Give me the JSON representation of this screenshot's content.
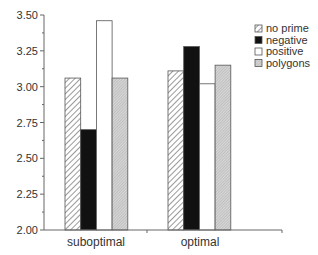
{
  "chart_data": {
    "type": "bar",
    "title": "",
    "xlabel": "",
    "ylabel": "",
    "categories": [
      "suboptimal",
      "optimal"
    ],
    "series": [
      {
        "name": "no prime",
        "pattern": "diagonal-hatch",
        "values": [
          3.06,
          3.11
        ]
      },
      {
        "name": "negative",
        "pattern": "solid-black",
        "values": [
          2.7,
          3.28
        ]
      },
      {
        "name": "positive",
        "pattern": "white",
        "values": [
          3.46,
          3.02
        ]
      },
      {
        "name": "polygons",
        "pattern": "fine-gray-hatch",
        "values": [
          3.06,
          3.15
        ]
      }
    ],
    "ylim": [
      2.0,
      3.5
    ],
    "yticks": [
      "2.00",
      "2.25",
      "2.50",
      "2.75",
      "3.00",
      "3.25",
      "3.50"
    ],
    "grid": false,
    "legend_position": "upper right"
  },
  "legend": {
    "items": [
      "no prime",
      "negative",
      "positive",
      "polygons"
    ]
  },
  "axis": {
    "x_labels": [
      "suboptimal",
      "optimal"
    ],
    "y_labels": [
      "2.00",
      "2.25",
      "2.50",
      "2.75",
      "3.00",
      "3.25",
      "3.50"
    ]
  }
}
